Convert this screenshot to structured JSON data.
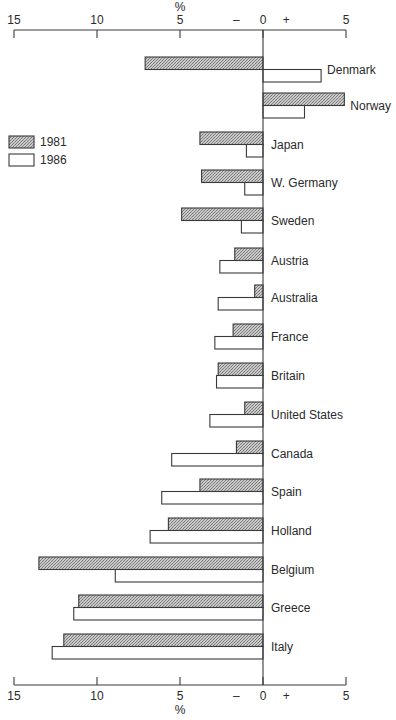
{
  "chart_data": {
    "type": "bar",
    "orientation": "horizontal",
    "title": "",
    "xlabel": "%",
    "ylabel": "",
    "xlim": [
      -15,
      5
    ],
    "axis_ticks": [
      {
        "value": -15,
        "label": "15"
      },
      {
        "value": -10,
        "label": "10"
      },
      {
        "value": -5,
        "label": "5"
      },
      {
        "value": 0,
        "label": "0"
      },
      {
        "value": 5,
        "label": "5"
      }
    ],
    "sign_markers": {
      "minus": "–",
      "plus": "+"
    },
    "axis_positions": [
      "top",
      "bottom"
    ],
    "grid": false,
    "legend_position": "left",
    "categories": [
      "Denmark",
      "Norway",
      "Japan",
      "W. Germany",
      "Sweden",
      "Austria",
      "Australia",
      "France",
      "Britain",
      "United States",
      "Canada",
      "Spain",
      "Holland",
      "Belgium",
      "Greece",
      "Italy"
    ],
    "series": [
      {
        "name": "1981",
        "pattern": "hatched",
        "color": "#b0b0b0",
        "values": [
          -7.1,
          4.9,
          -3.8,
          -3.7,
          -4.9,
          -1.7,
          -0.5,
          -1.8,
          -2.7,
          -1.1,
          -1.6,
          -3.8,
          -5.7,
          -13.5,
          -11.1,
          -12.0
        ]
      },
      {
        "name": "1986",
        "pattern": "open",
        "color": "#ffffff",
        "values": [
          3.5,
          2.5,
          -1.0,
          -1.1,
          -1.3,
          -2.6,
          -2.7,
          -2.9,
          -2.8,
          -3.2,
          -5.5,
          -6.1,
          -6.8,
          -8.9,
          -11.4,
          -12.7
        ]
      }
    ]
  },
  "legend": {
    "items": [
      {
        "label": "1981"
      },
      {
        "label": "1986"
      }
    ]
  },
  "axis": {
    "unit_label": "%",
    "minus": "–",
    "plus": "+"
  }
}
